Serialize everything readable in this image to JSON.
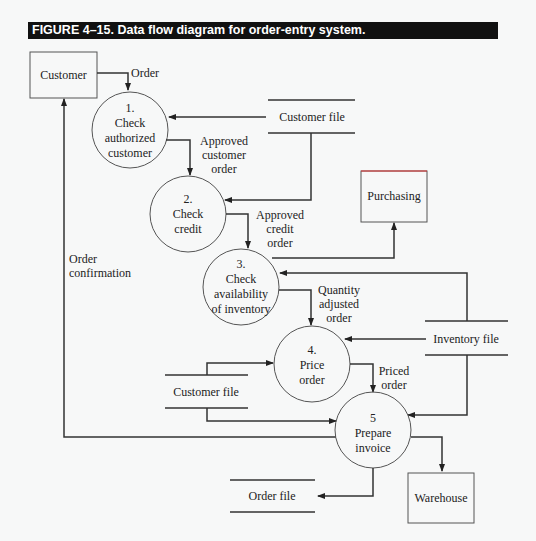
{
  "figure": {
    "caption": "FIGURE 4–15. Data flow diagram for order-entry system."
  },
  "entities": {
    "customer": "Customer",
    "purchasing": "Purchasing",
    "warehouse": "Warehouse"
  },
  "processes": [
    {
      "num": "1.",
      "lines": [
        "Check",
        "authorized",
        "customer"
      ]
    },
    {
      "num": "2.",
      "lines": [
        "Check",
        "credit"
      ]
    },
    {
      "num": "3.",
      "lines": [
        "Check",
        "availability",
        "of inventory"
      ]
    },
    {
      "num": "4.",
      "lines": [
        "Price",
        "order"
      ]
    },
    {
      "num": "5",
      "lines": [
        "Prepare",
        "invoice"
      ]
    }
  ],
  "stores": {
    "customer_file_top": "Customer file",
    "inventory_file": "Inventory file",
    "customer_file_bottom": "Customer file",
    "order_file": "Order file"
  },
  "flows": {
    "order": "Order",
    "approved_customer_order": [
      "Approved",
      "customer",
      "order"
    ],
    "approved_credit_order": [
      "Approved",
      "credit",
      "order"
    ],
    "quantity_adjusted_order": [
      "Quantity",
      "adjusted",
      "order"
    ],
    "priced_order": [
      "Priced",
      "order"
    ],
    "order_confirmation": [
      "Order",
      "confirmation"
    ]
  }
}
